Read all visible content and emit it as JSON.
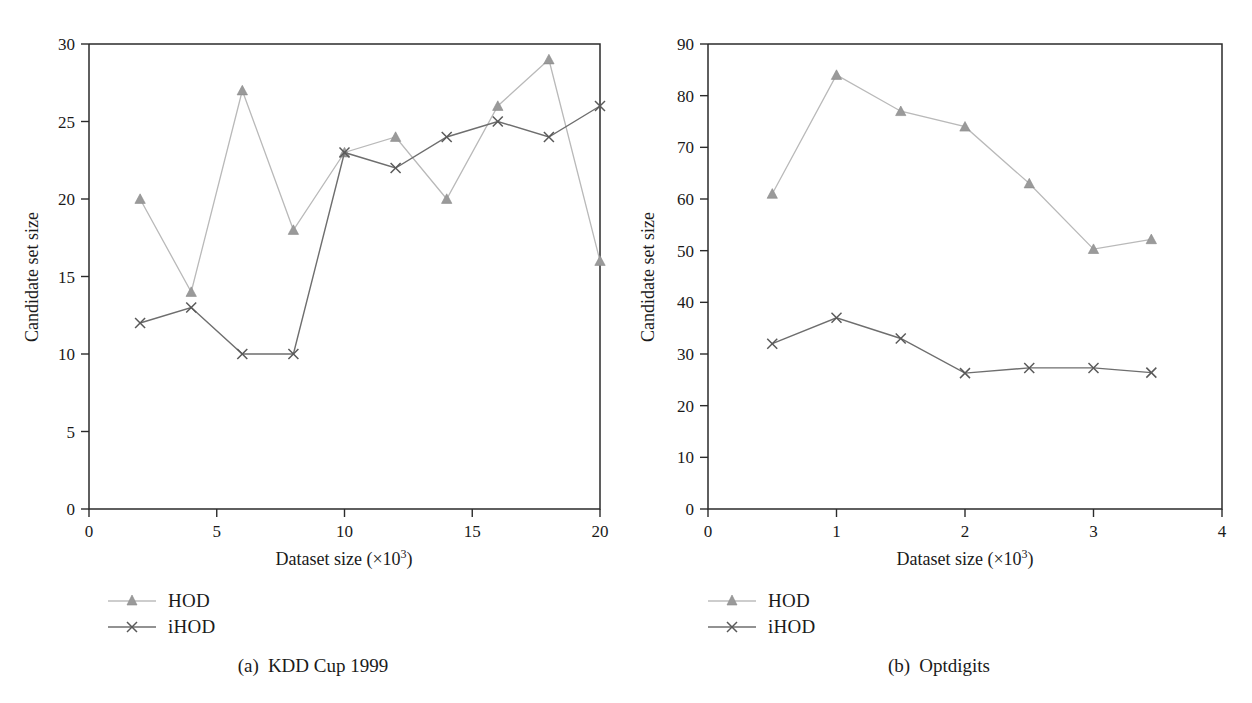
{
  "figure": {
    "panels": [
      {
        "caption_index": "(a)",
        "caption_text": "KDD Cup 1999",
        "y_axis_title": "Candidate set size",
        "x_axis_title_main": "Dataset size (×10",
        "x_axis_title_sup": "3",
        "x_axis_title_tail": ")",
        "legend": [
          {
            "label": "HOD",
            "marker": "triangle-marker",
            "color": "#9a9a9a"
          },
          {
            "label": "iHOD",
            "marker": "x-marker",
            "color": "#595959"
          }
        ]
      },
      {
        "caption_index": "(b)",
        "caption_text": "Optdigits",
        "y_axis_title": "Candidate set size",
        "x_axis_title_main": "Dataset size (×10",
        "x_axis_title_sup": "3",
        "x_axis_title_tail": ")",
        "legend": [
          {
            "label": "HOD",
            "marker": "triangle-marker",
            "color": "#9a9a9a"
          },
          {
            "label": "iHOD",
            "marker": "x-marker",
            "color": "#595959"
          }
        ]
      }
    ]
  },
  "chart_data": [
    {
      "type": "line",
      "title": "(a) KDD Cup 1999",
      "xlabel": "Dataset size (×10^3)",
      "ylabel": "Candidate set size",
      "xlim": [
        0,
        20
      ],
      "ylim": [
        0,
        30
      ],
      "xticks": [
        0,
        5,
        10,
        15,
        20
      ],
      "yticks": [
        0,
        5,
        10,
        15,
        20,
        25,
        30
      ],
      "xtick_labels": [
        "0",
        "5",
        "10",
        "15",
        "20"
      ],
      "ytick_labels": [
        "0",
        "5",
        "10",
        "15",
        "20",
        "25",
        "30"
      ],
      "grid": false,
      "legend_position": "below-left",
      "x": [
        2,
        4,
        6,
        8,
        10,
        12,
        14,
        16,
        18,
        20
      ],
      "series": [
        {
          "name": "HOD",
          "marker": "triangle",
          "color": "#9a9a9a",
          "values": [
            20,
            14,
            27,
            18,
            23,
            24,
            20,
            26,
            29,
            16
          ]
        },
        {
          "name": "iHOD",
          "marker": "x",
          "color": "#595959",
          "values": [
            12,
            13,
            10,
            10,
            23,
            22,
            24,
            25,
            24,
            26
          ]
        }
      ]
    },
    {
      "type": "line",
      "title": "(b) Optdigits",
      "xlabel": "Dataset size (×10^3)",
      "ylabel": "Candidate set size",
      "xlim": [
        0,
        4
      ],
      "ylim": [
        0,
        90
      ],
      "xticks": [
        0,
        1,
        2,
        3,
        4
      ],
      "yticks": [
        0,
        10,
        20,
        30,
        40,
        50,
        60,
        70,
        80,
        90
      ],
      "xtick_labels": [
        "0",
        "1",
        "2",
        "3",
        "4"
      ],
      "ytick_labels": [
        "0",
        "10",
        "20",
        "30",
        "40",
        "50",
        "60",
        "70",
        "80",
        "90"
      ],
      "grid": false,
      "legend_position": "below-left",
      "x": [
        0.5,
        1.0,
        1.5,
        2.0,
        2.5,
        3.0,
        3.45
      ],
      "series": [
        {
          "name": "HOD",
          "marker": "triangle",
          "color": "#9a9a9a",
          "values": [
            61,
            84,
            77,
            74,
            63,
            50.3,
            52.2
          ]
        },
        {
          "name": "iHOD",
          "marker": "x",
          "color": "#595959",
          "values": [
            32,
            37,
            33,
            26.3,
            27.3,
            27.3,
            26.4
          ]
        }
      ]
    }
  ]
}
